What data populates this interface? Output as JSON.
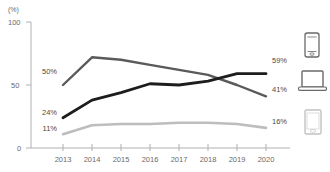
{
  "chart_data": {
    "type": "line",
    "title": "",
    "subtitle": "",
    "xlabel": "",
    "ylabel": "",
    "unit_label": "(%)",
    "categories": [
      "2013",
      "2014",
      "2015",
      "2016",
      "2017",
      "2018",
      "2019",
      "2020"
    ],
    "x": [
      2013,
      2014,
      2015,
      2016,
      2017,
      2018,
      2019,
      2020
    ],
    "ylim": [
      0,
      100
    ],
    "y_ticks": [
      "0",
      "50",
      "100"
    ],
    "y_tick_values": [
      0,
      50,
      100
    ],
    "grid": false,
    "legend_position": "right-icons",
    "series": [
      {
        "name": "laptop",
        "color": "#5a5a5a",
        "start_label": "50%",
        "end_label": "41%",
        "values": [
          50,
          72,
          70,
          66,
          62,
          58,
          50,
          41
        ]
      },
      {
        "name": "smartphone",
        "color": "#1d1d1d",
        "start_label": "24%",
        "end_label": "59%",
        "values": [
          24,
          38,
          44,
          51,
          50,
          53,
          59,
          59
        ]
      },
      {
        "name": "tablet",
        "color": "#bdbdbd",
        "start_label": "11%",
        "end_label": "16%",
        "values": [
          11,
          18,
          19,
          19,
          20,
          20,
          19,
          16
        ]
      }
    ],
    "annotations": {
      "left_labels": [
        "50%",
        "24%",
        "11%"
      ],
      "right_labels": [
        "59%",
        "41%",
        "16%"
      ]
    },
    "legend_icons": [
      {
        "icon": "smartphone-icon",
        "series": "smartphone",
        "value_label": "59%",
        "color": "#5a5a5a"
      },
      {
        "icon": "laptop-icon",
        "series": "laptop",
        "value_label": "41%",
        "color": "#5a5a5a"
      },
      {
        "icon": "tablet-icon",
        "series": "tablet",
        "value_label": "16%",
        "color": "#bdbdbd"
      }
    ]
  },
  "axis": {
    "unit": "(%)",
    "y_top": "100",
    "y_mid": "50",
    "y_zero": "0"
  },
  "x_labels": {
    "y2013": "2013",
    "y2014": "2014",
    "y2015": "2015",
    "y2016": "2016",
    "y2017": "2017",
    "y2018": "2018",
    "y2019": "2019",
    "y2020": "2020"
  },
  "start_labels": {
    "laptop": "50%",
    "smartphone": "24%",
    "tablet": "11%"
  },
  "end_labels": {
    "smartphone": "59%",
    "laptop": "41%",
    "tablet": "16%"
  }
}
